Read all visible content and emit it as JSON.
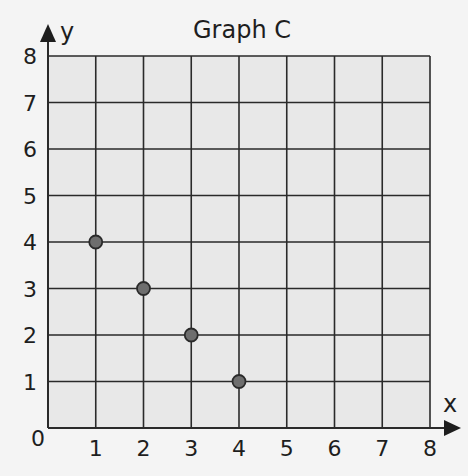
{
  "chart_data": {
    "type": "scatter",
    "title": "Graph C",
    "xlabel": "x",
    "ylabel": "y",
    "xlim": [
      0,
      8
    ],
    "ylim": [
      0,
      8
    ],
    "grid": true,
    "x_ticks": [
      "0",
      "1",
      "2",
      "3",
      "4",
      "5",
      "6",
      "7",
      "8"
    ],
    "y_ticks": [
      "1",
      "2",
      "3",
      "4",
      "5",
      "6",
      "7",
      "8"
    ],
    "points": [
      {
        "x": 1,
        "y": 4
      },
      {
        "x": 2,
        "y": 3
      },
      {
        "x": 3,
        "y": 2
      },
      {
        "x": 4,
        "y": 1
      }
    ],
    "x": [
      1,
      2,
      3,
      4
    ],
    "y": [
      4,
      3,
      2,
      1
    ],
    "legend": null
  },
  "colors": {
    "background": "#f4f4f4",
    "plot_fill": "#e8e8e8",
    "grid_line": "#2a2a2a",
    "point_fill": "#6e6e6e",
    "point_stroke": "#2a2a2a",
    "text": "#1e1e1e"
  }
}
